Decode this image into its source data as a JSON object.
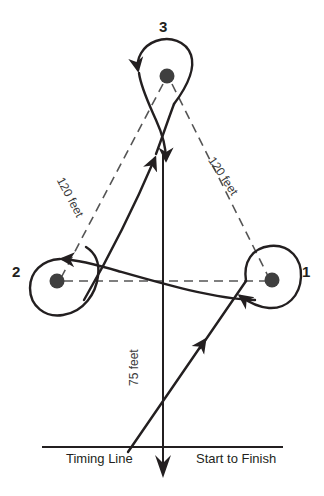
{
  "diagram": {
    "type": "barrel-racing-pattern",
    "colors": {
      "ink": "#231f20",
      "barrel_fill": "#3f3f3f",
      "background": "#ffffff",
      "dashed_line": "#555555"
    },
    "barrels": [
      {
        "id": "barrel-1",
        "label": "1",
        "x": 272,
        "y": 280,
        "turn_direction": "counterclockwise"
      },
      {
        "id": "barrel-2",
        "label": "2",
        "x": 57,
        "y": 281,
        "turn_direction": "clockwise"
      },
      {
        "id": "barrel-3",
        "label": "3",
        "x": 167,
        "y": 76,
        "turn_direction": "clockwise"
      }
    ],
    "dimensions": [
      {
        "id": "dim-left",
        "label": "120 feet",
        "from": "barrel-2",
        "to": "barrel-3"
      },
      {
        "id": "dim-right",
        "label": "120 feet",
        "from": "barrel-3",
        "to": "barrel-1"
      },
      {
        "id": "dim-center",
        "label": "75 feet",
        "from": "timing-line",
        "to": "center"
      }
    ],
    "base": {
      "timing_line_label": "Timing Line",
      "start_finish_label": "Start to Finish"
    }
  }
}
